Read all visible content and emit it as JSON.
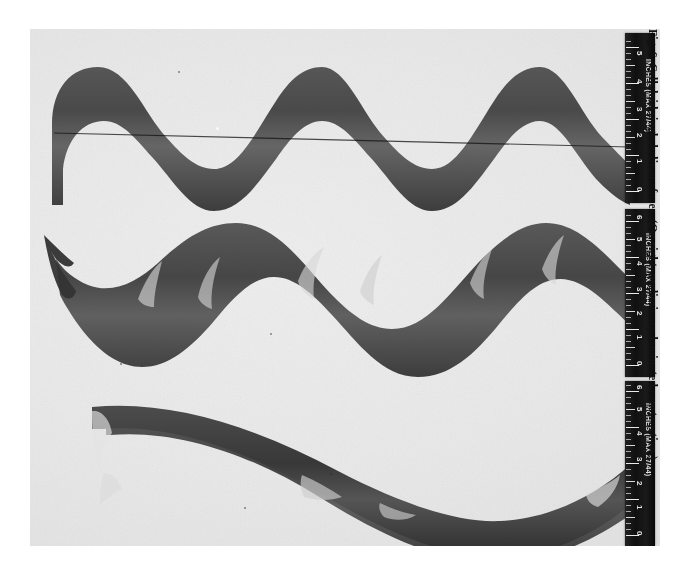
{
  "figure": {
    "number": "Fig. 6",
    "caption": "Celluloid single helix surfaces. (On right, preliminary laminated construction.)",
    "full_caption": "Fig. 6  Celluloid single helix surfaces. (On right, preliminary laminated construction.)"
  },
  "plate": {
    "type": "halftone-photograph",
    "background_color": "#e8e8e8",
    "subject_color": "#3a3a3a",
    "specimen_count": 3
  },
  "specimens": [
    {
      "name": "helix-top",
      "description": "Celluloid single helix surface, short pitch, six lobes",
      "lobes": 6,
      "period_px": 96,
      "amplitude_px": 56
    },
    {
      "name": "helix-middle",
      "description": "Celluloid single helix surface, medium pitch, three lobes with tapered left tail",
      "lobes": 3,
      "period_px": 182,
      "amplitude_px": 62
    },
    {
      "name": "helix-bottom",
      "description": "Celluloid single helix surface, long pitch, laminated construction",
      "lobes": 2,
      "period_px": 300,
      "amplitude_px": 66
    }
  ],
  "rulers": [
    {
      "name": "ruler-top",
      "label": "INCHES (MAX 27/44)",
      "short_label": "INCHES",
      "numbers": [
        "0",
        "1",
        "2",
        "3",
        "4",
        "5"
      ],
      "units": "inches",
      "body_color": "#141414",
      "mark_color": "#e6e6e6"
    },
    {
      "name": "ruler-middle",
      "label": "INCHES (MAX 27/44)",
      "short_label": "INCHES",
      "numbers": [
        "0",
        "1",
        "2",
        "3",
        "4",
        "5",
        "6"
      ],
      "units": "inches",
      "body_color": "#141414",
      "mark_color": "#e6e6e6"
    },
    {
      "name": "ruler-bottom",
      "label": "INCHES (MAX 27/44)",
      "short_label": "INCHES",
      "numbers": [
        "0",
        "1",
        "2",
        "3",
        "4",
        "5",
        "6"
      ],
      "units": "inches",
      "body_color": "#141414",
      "mark_color": "#e6e6e6"
    }
  ]
}
